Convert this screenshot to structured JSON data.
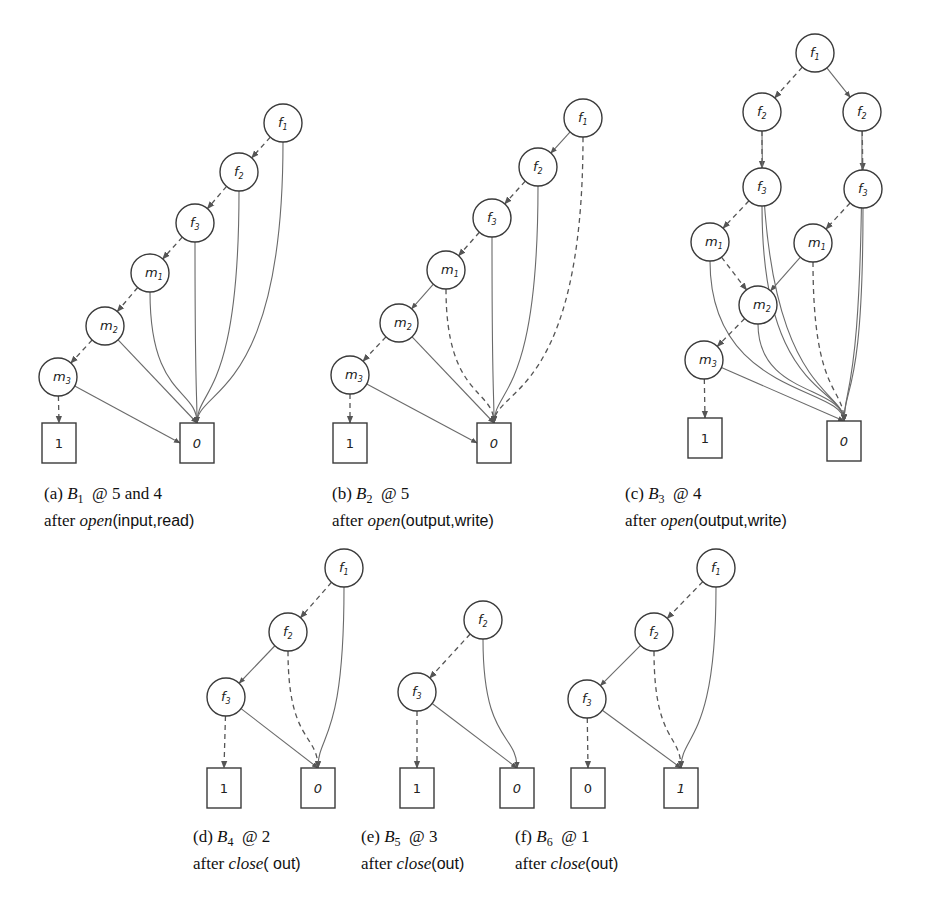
{
  "figure": {
    "panels": [
      {
        "id": "a",
        "caption": {
          "tag": "(a)",
          "bdd": "B",
          "bdd_index": "1",
          "at_text": "@ 5 and 4",
          "prefix": "after",
          "op": "open",
          "args": "(input,read)"
        },
        "nodes": [
          {
            "id": "f1",
            "var": "f",
            "idx": "1",
            "x": 283,
            "y": 123
          },
          {
            "id": "f2",
            "var": "f",
            "idx": "2",
            "x": 239,
            "y": 172
          },
          {
            "id": "f3",
            "var": "f",
            "idx": "3",
            "x": 195,
            "y": 223
          },
          {
            "id": "m1",
            "var": "m",
            "idx": "1",
            "x": 150,
            "y": 273
          },
          {
            "id": "m2",
            "var": "m",
            "idx": "2",
            "x": 105,
            "y": 326
          },
          {
            "id": "m3",
            "var": "m",
            "idx": "3",
            "x": 58,
            "y": 377
          }
        ],
        "terminals": [
          {
            "id": "t1",
            "label": "1",
            "italic": false,
            "x": 59,
            "y": 443
          },
          {
            "id": "t0",
            "label": "0",
            "italic": true,
            "x": 197,
            "y": 443
          }
        ],
        "edges": [
          {
            "from": "f1",
            "to": "f2",
            "style": "dashed"
          },
          {
            "from": "f2",
            "to": "f3",
            "style": "dashed"
          },
          {
            "from": "f3",
            "to": "m1",
            "style": "dashed"
          },
          {
            "from": "m1",
            "to": "m2",
            "style": "dashed"
          },
          {
            "from": "m2",
            "to": "m3",
            "style": "dashed"
          },
          {
            "from": "m3",
            "to": "t1",
            "style": "dashed"
          },
          {
            "from": "m3",
            "to": "t0",
            "style": "solid"
          },
          {
            "from": "m2",
            "to": "t0",
            "style": "solid"
          },
          {
            "from": "m1",
            "to": "t0",
            "style": "solid"
          },
          {
            "from": "f3",
            "to": "t0",
            "style": "solid"
          },
          {
            "from": "f2",
            "to": "t0",
            "style": "solid"
          },
          {
            "from": "f1",
            "to": "t0",
            "style": "solid"
          }
        ]
      },
      {
        "id": "b",
        "caption": {
          "tag": "(b)",
          "bdd": "B",
          "bdd_index": "2",
          "at_text": "@ 5",
          "prefix": "after",
          "op": "open",
          "args": "(output,write)"
        },
        "nodes": [
          {
            "id": "f1",
            "var": "f",
            "idx": "1",
            "x": 583,
            "y": 118
          },
          {
            "id": "f2",
            "var": "f",
            "idx": "2",
            "x": 538,
            "y": 167
          },
          {
            "id": "f3",
            "var": "f",
            "idx": "3",
            "x": 492,
            "y": 218
          },
          {
            "id": "m1",
            "var": "m",
            "idx": "1",
            "x": 446,
            "y": 270
          },
          {
            "id": "m2",
            "var": "m",
            "idx": "2",
            "x": 399,
            "y": 323
          },
          {
            "id": "m3",
            "var": "m",
            "idx": "3",
            "x": 350,
            "y": 375
          }
        ],
        "terminals": [
          {
            "id": "t1",
            "label": "1",
            "italic": false,
            "x": 350,
            "y": 443
          },
          {
            "id": "t0",
            "label": "0",
            "italic": true,
            "x": 494,
            "y": 443
          }
        ],
        "edges": [
          {
            "from": "f1",
            "to": "f2",
            "style": "solid"
          },
          {
            "from": "f2",
            "to": "f3",
            "style": "dashed"
          },
          {
            "from": "f3",
            "to": "m1",
            "style": "dashed"
          },
          {
            "from": "m1",
            "to": "m2",
            "style": "solid"
          },
          {
            "from": "m2",
            "to": "m3",
            "style": "dashed"
          },
          {
            "from": "m3",
            "to": "t1",
            "style": "dashed"
          },
          {
            "from": "m3",
            "to": "t0",
            "style": "solid"
          },
          {
            "from": "m2",
            "to": "t0",
            "style": "solid"
          },
          {
            "from": "m1",
            "to": "t0",
            "style": "dashed"
          },
          {
            "from": "f3",
            "to": "t0",
            "style": "solid"
          },
          {
            "from": "f2",
            "to": "t0",
            "style": "solid"
          },
          {
            "from": "f1",
            "to": "t0",
            "style": "dashed"
          }
        ]
      },
      {
        "id": "c",
        "caption": {
          "tag": "(c)",
          "bdd": "B",
          "bdd_index": "3",
          "at_text": "@ 4",
          "prefix": "after",
          "op": "open",
          "args": "(output,write)"
        },
        "nodes": [
          {
            "id": "f1",
            "var": "f",
            "idx": "1",
            "x": 815,
            "y": 53
          },
          {
            "id": "f2L",
            "var": "f",
            "idx": "2",
            "x": 762,
            "y": 112
          },
          {
            "id": "f2R",
            "var": "f",
            "idx": "2",
            "x": 862,
            "y": 112
          },
          {
            "id": "f3L",
            "var": "f",
            "idx": "3",
            "x": 762,
            "y": 187
          },
          {
            "id": "f3R",
            "var": "f",
            "idx": "3",
            "x": 863,
            "y": 189
          },
          {
            "id": "m1L",
            "var": "m",
            "idx": "1",
            "x": 710,
            "y": 242
          },
          {
            "id": "m1R",
            "var": "m",
            "idx": "1",
            "x": 813,
            "y": 243
          },
          {
            "id": "m2",
            "var": "m",
            "idx": "2",
            "x": 758,
            "y": 305
          },
          {
            "id": "m3",
            "var": "m",
            "idx": "3",
            "x": 704,
            "y": 360
          }
        ],
        "terminals": [
          {
            "id": "t1",
            "label": "1",
            "italic": false,
            "x": 705,
            "y": 438
          },
          {
            "id": "t0",
            "label": "0",
            "italic": true,
            "x": 844,
            "y": 441
          }
        ],
        "edges": [
          {
            "from": "f1",
            "to": "f2L",
            "style": "dashed"
          },
          {
            "from": "f1",
            "to": "f2R",
            "style": "solid"
          },
          {
            "from": "f2L",
            "to": "f3L",
            "style": "dashed"
          },
          {
            "from": "f2R",
            "to": "f3R",
            "style": "dashed"
          },
          {
            "from": "f3L",
            "to": "m1L",
            "style": "dashed"
          },
          {
            "from": "f3R",
            "to": "m1R",
            "style": "dashed"
          },
          {
            "from": "m1L",
            "to": "m2",
            "style": "dashed"
          },
          {
            "from": "m1R",
            "to": "m2",
            "style": "solid"
          },
          {
            "from": "m2",
            "to": "m3",
            "style": "dashed"
          },
          {
            "from": "m3",
            "to": "t1",
            "style": "dashed"
          },
          {
            "from": "m3",
            "to": "t0",
            "style": "solid"
          },
          {
            "from": "m2",
            "to": "t0",
            "style": "solid"
          },
          {
            "from": "m1L",
            "to": "t0",
            "style": "solid"
          },
          {
            "from": "m1R",
            "to": "t0",
            "style": "dashed"
          },
          {
            "from": "f3L",
            "to": "t0",
            "style": "solid"
          },
          {
            "from": "f3R",
            "to": "t0",
            "style": "solid"
          },
          {
            "from": "f2L",
            "to": "t0",
            "style": "solid"
          },
          {
            "from": "f2R",
            "to": "t0",
            "style": "solid"
          }
        ]
      },
      {
        "id": "d",
        "caption": {
          "tag": "(d)",
          "bdd": "B",
          "bdd_index": "4",
          "at_text": "@ 2",
          "prefix": "after",
          "op": "close",
          "args": "( out)"
        },
        "nodes": [
          {
            "id": "f1",
            "var": "f",
            "idx": "1",
            "x": 344,
            "y": 568
          },
          {
            "id": "f2",
            "var": "f",
            "idx": "2",
            "x": 288,
            "y": 632
          },
          {
            "id": "f3",
            "var": "f",
            "idx": "3",
            "x": 226,
            "y": 697
          }
        ],
        "terminals": [
          {
            "id": "t1",
            "label": "1",
            "italic": false,
            "x": 224,
            "y": 788
          },
          {
            "id": "t0",
            "label": "0",
            "italic": true,
            "x": 318,
            "y": 788
          }
        ],
        "edges": [
          {
            "from": "f1",
            "to": "f2",
            "style": "dashed"
          },
          {
            "from": "f2",
            "to": "f3",
            "style": "solid"
          },
          {
            "from": "f3",
            "to": "t1",
            "style": "dashed"
          },
          {
            "from": "f3",
            "to": "t0",
            "style": "solid"
          },
          {
            "from": "f2",
            "to": "t0",
            "style": "dashed"
          },
          {
            "from": "f1",
            "to": "t0",
            "style": "solid"
          }
        ]
      },
      {
        "id": "e",
        "caption": {
          "tag": "(e)",
          "bdd": "B",
          "bdd_index": "5",
          "at_text": "@ 3",
          "prefix": "after",
          "op": "close",
          "args": "(out)"
        },
        "nodes": [
          {
            "id": "f2",
            "var": "f",
            "idx": "2",
            "x": 483,
            "y": 620
          },
          {
            "id": "f3",
            "var": "f",
            "idx": "3",
            "x": 417,
            "y": 692
          }
        ],
        "terminals": [
          {
            "id": "t1",
            "label": "1",
            "italic": false,
            "x": 417,
            "y": 788
          },
          {
            "id": "t0",
            "label": "0",
            "italic": true,
            "x": 517,
            "y": 788
          }
        ],
        "edges": [
          {
            "from": "f2",
            "to": "f3",
            "style": "dashed"
          },
          {
            "from": "f3",
            "to": "t1",
            "style": "dashed"
          },
          {
            "from": "f3",
            "to": "t0",
            "style": "solid"
          },
          {
            "from": "f2",
            "to": "t0",
            "style": "solid"
          }
        ]
      },
      {
        "id": "f",
        "caption": {
          "tag": "(f)",
          "bdd": "B",
          "bdd_index": "6",
          "at_text": "@ 1",
          "prefix": "after",
          "op": "close",
          "args": "(out)"
        },
        "nodes": [
          {
            "id": "f1",
            "var": "f",
            "idx": "1",
            "x": 716,
            "y": 568
          },
          {
            "id": "f2",
            "var": "f",
            "idx": "2",
            "x": 654,
            "y": 632
          },
          {
            "id": "f3",
            "var": "f",
            "idx": "3",
            "x": 587,
            "y": 699
          }
        ],
        "terminals": [
          {
            "id": "t0",
            "label": "0",
            "italic": false,
            "x": 588,
            "y": 788
          },
          {
            "id": "t1",
            "label": "1",
            "italic": true,
            "x": 681,
            "y": 788
          }
        ],
        "edges": [
          {
            "from": "f1",
            "to": "f2",
            "style": "dashed"
          },
          {
            "from": "f2",
            "to": "f3",
            "style": "solid"
          },
          {
            "from": "f3",
            "to": "t0",
            "style": "dashed"
          },
          {
            "from": "f3",
            "to": "t1",
            "style": "solid"
          },
          {
            "from": "f2",
            "to": "t1",
            "style": "dashed"
          },
          {
            "from": "f1",
            "to": "t1",
            "style": "solid"
          }
        ]
      }
    ]
  }
}
